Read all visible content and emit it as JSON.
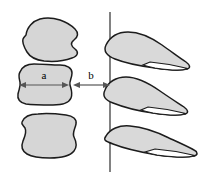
{
  "figure": {
    "type": "schematic-diagram",
    "title": "",
    "background_color": "#ffffff",
    "width": 202,
    "height": 175,
    "colors": {
      "shape_fill": "#d6d6d6",
      "shape_stroke": "#1c1c1c",
      "wing_fill": "#d9d9d9",
      "wing_stroke": "#1c1c1c",
      "divider_stroke": "#1a1a1a",
      "arrow_stroke": "#555555",
      "label_color": "#000000"
    },
    "labels": {
      "a": "a",
      "b": "b"
    },
    "left_shapes": [
      {
        "id": "blob-top",
        "label": ""
      },
      {
        "id": "blob-middle",
        "label": ""
      },
      {
        "id": "blob-bottom",
        "label": ""
      }
    ],
    "right_shapes": [
      {
        "id": "wing-top",
        "label": ""
      },
      {
        "id": "wing-middle",
        "label": ""
      },
      {
        "id": "wing-bottom",
        "label": ""
      }
    ],
    "divider": {
      "id": "vertical-line",
      "x": 110,
      "y_top": 12,
      "y_bottom": 172
    },
    "dimensions": [
      {
        "id": "dimension-a",
        "label": "a",
        "x_start": 20,
        "x_end": 68,
        "y": 85,
        "label_x": 44,
        "label_y": 79
      },
      {
        "id": "dimension-b",
        "label": "b",
        "x_start": 74,
        "x_end": 109,
        "y": 85,
        "label_x": 91,
        "label_y": 79
      }
    ]
  }
}
